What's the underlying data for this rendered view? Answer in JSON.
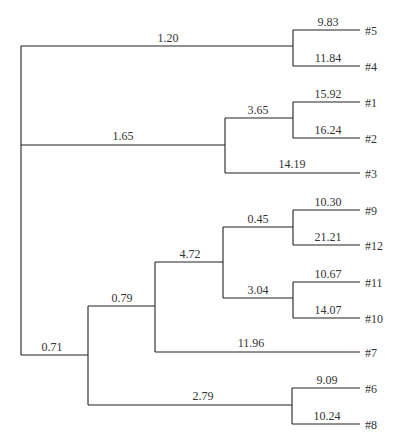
{
  "diagram": {
    "type": "dendrogram",
    "leaves": [
      "#5",
      "#4",
      "#1",
      "#2",
      "#3",
      "#9",
      "#12",
      "#11",
      "#10",
      "#7",
      "#6",
      "#8"
    ],
    "branch_labels": {
      "b_1_20": "1.20",
      "b_9_83": "9.83",
      "b_11_84": "11.84",
      "b_1_65": "1.65",
      "b_3_65": "3.65",
      "b_15_92": "15.92",
      "b_16_24": "16.24",
      "b_14_19": "14.19",
      "b_0_71": "0.71",
      "b_0_79": "0.79",
      "b_4_72": "4.72",
      "b_0_45": "0.45",
      "b_10_30": "10.30",
      "b_21_21": "21.21",
      "b_3_04": "3.04",
      "b_10_67": "10.67",
      "b_14_07": "14.07",
      "b_11_96": "11.96",
      "b_2_79": "2.79",
      "b_9_09": "9.09",
      "b_10_24": "10.24"
    },
    "leaf_labels": {
      "l5": "#5",
      "l4": "#4",
      "l1": "#1",
      "l2": "#2",
      "l3": "#3",
      "l9": "#9",
      "l12": "#12",
      "l11": "#11",
      "l10": "#10",
      "l7": "#7",
      "l6": "#6",
      "l8": "#8"
    }
  }
}
